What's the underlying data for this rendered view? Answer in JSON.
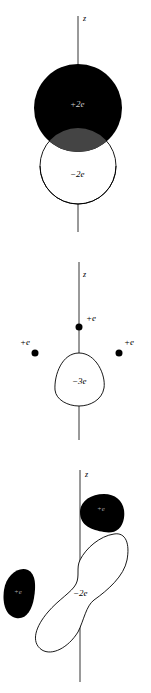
{
  "figure": {
    "axis_label": "z",
    "panels": [
      {
        "id": "panel-1",
        "description": "Overlapping positive and negative spherical charge distributions",
        "positive_charge": {
          "label": "+2e",
          "sign": "+",
          "magnitude": "2",
          "unit": "e",
          "fill": "#000000"
        },
        "negative_charge": {
          "label": "−2e",
          "sign": "−",
          "magnitude": "2",
          "unit": "e",
          "fill": "#ffffff"
        },
        "overlap_fill": "#444444"
      },
      {
        "id": "panel-2",
        "description": "Three point positive charges around a negative charge cloud",
        "point_charges": [
          {
            "label": "+e",
            "position": "top"
          },
          {
            "label": "+e",
            "position": "left"
          },
          {
            "label": "+e",
            "position": "right"
          }
        ],
        "negative_charge": {
          "label": "−3e"
        }
      },
      {
        "id": "panel-3",
        "description": "Two positive charge blobs flanking a tilted negative charge cloud",
        "positive_charges": [
          {
            "label": "+e",
            "position": "upper-right"
          },
          {
            "label": "+e",
            "position": "lower-left"
          }
        ],
        "negative_charge": {
          "label": "−2e"
        }
      }
    ],
    "colors": {
      "ink": "#000000",
      "overlap": "#444444",
      "background": "#ffffff",
      "label_on_dark": "#cccccc"
    }
  }
}
